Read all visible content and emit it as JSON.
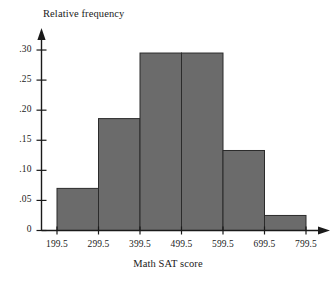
{
  "chart_data": {
    "type": "bar",
    "title": "",
    "subtitle": "",
    "xlabel": "Math SAT score",
    "ylabel": "Relative frequency",
    "grid": false,
    "legend": "none",
    "bin_edges": [
      199.5,
      299.5,
      399.5,
      499.5,
      599.5,
      699.5,
      799.5
    ],
    "categories": [
      "199.5-299.5",
      "299.5-399.5",
      "399.5-499.5",
      "499.5-599.5",
      "599.5-699.5",
      "699.5-799.5"
    ],
    "values": [
      0.07,
      0.186,
      0.295,
      0.295,
      0.133,
      0.025
    ],
    "xlim": [
      199.5,
      799.5
    ],
    "ylim": [
      0,
      0.315
    ],
    "x_tick_labels": [
      "199.5",
      "299.5",
      "399.5",
      "499.5",
      "599.5",
      "699.5",
      "799.5"
    ],
    "y_tick_labels": [
      "0",
      ".05",
      ".10",
      ".15",
      ".20",
      ".25",
      ".30"
    ],
    "y_tick_values": [
      0,
      0.05,
      0.1,
      0.15,
      0.2,
      0.25,
      0.3
    ],
    "bar_color": "#6b6b6b",
    "bar_edge_color": "#2b2b2b",
    "axis_color": "#1a1a1a"
  }
}
